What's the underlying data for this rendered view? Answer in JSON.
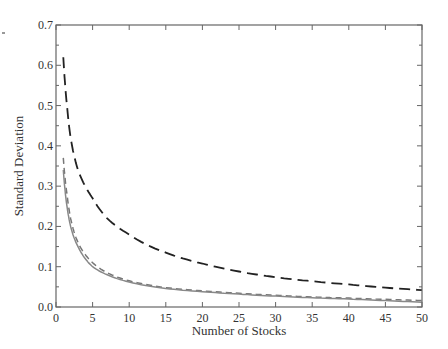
{
  "chart_data": {
    "type": "line",
    "title": "",
    "xlabel": "Number of Stocks",
    "ylabel": "Standard Deviation",
    "xlim": [
      0,
      50
    ],
    "ylim": [
      0,
      0.7
    ],
    "xticks": [
      "0",
      "5",
      "10",
      "15",
      "20",
      "25",
      "30",
      "35",
      "40",
      "45",
      "50"
    ],
    "yticks": [
      "0.0",
      "0.1",
      "0.2",
      "0.3",
      "0.4",
      "0.5",
      "0.6",
      "0.7"
    ],
    "grid": false,
    "legend": null,
    "series": [
      {
        "name": "long-dashed (black)",
        "style": "long-dash",
        "color": "#222222",
        "x": [
          1,
          1.5,
          2,
          3,
          4,
          5,
          7,
          10,
          15,
          20,
          25,
          30,
          35,
          40,
          45,
          50
        ],
        "values": [
          0.62,
          0.5,
          0.42,
          0.34,
          0.3,
          0.27,
          0.22,
          0.18,
          0.135,
          0.108,
          0.088,
          0.074,
          0.064,
          0.056,
          0.048,
          0.042
        ]
      },
      {
        "name": "short-dashed (gray)",
        "style": "short-dash",
        "color": "#777777",
        "x": [
          1,
          1.5,
          2,
          3,
          4,
          5,
          7,
          10,
          15,
          20,
          25,
          30,
          35,
          40,
          45,
          50
        ],
        "values": [
          0.37,
          0.28,
          0.22,
          0.16,
          0.13,
          0.11,
          0.085,
          0.065,
          0.048,
          0.04,
          0.034,
          0.029,
          0.025,
          0.022,
          0.019,
          0.016
        ]
      },
      {
        "name": "solid (gray)",
        "style": "solid",
        "color": "#888888",
        "x": [
          1,
          1.5,
          2,
          3,
          4,
          5,
          7,
          10,
          15,
          20,
          25,
          30,
          35,
          40,
          45,
          50
        ],
        "values": [
          0.34,
          0.25,
          0.2,
          0.15,
          0.12,
          0.1,
          0.08,
          0.062,
          0.046,
          0.038,
          0.032,
          0.027,
          0.023,
          0.02,
          0.016,
          0.012
        ]
      }
    ]
  }
}
